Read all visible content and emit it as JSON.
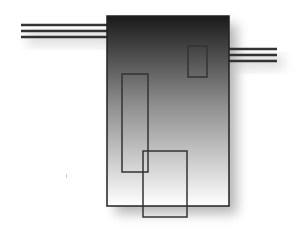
{
  "diagram": {
    "canvas": {
      "width": 298,
      "height": 239,
      "background": "#ffffff"
    },
    "main_block": {
      "x": 107,
      "y": 16,
      "width": 122,
      "height": 190,
      "gradient_top": "#1a1a1a",
      "gradient_bottom": "#ffffff",
      "stroke": "#222222"
    },
    "inner_rects": [
      {
        "name": "small-top-right-rect",
        "x": 188,
        "y": 46,
        "width": 19,
        "height": 31
      },
      {
        "name": "tall-left-rect",
        "x": 122,
        "y": 74,
        "width": 26,
        "height": 98
      },
      {
        "name": "bottom-overhang-rect",
        "x": 143,
        "y": 151,
        "width": 44,
        "height": 66
      }
    ],
    "left_leads": {
      "x1": 21,
      "x2": 107,
      "ys": [
        25,
        31,
        37
      ]
    },
    "right_leads": {
      "x1": 229,
      "x2": 277,
      "ys": [
        49,
        55,
        61
      ]
    },
    "stroke_color": "#333333",
    "shadow_color": "#9a9a9a"
  }
}
